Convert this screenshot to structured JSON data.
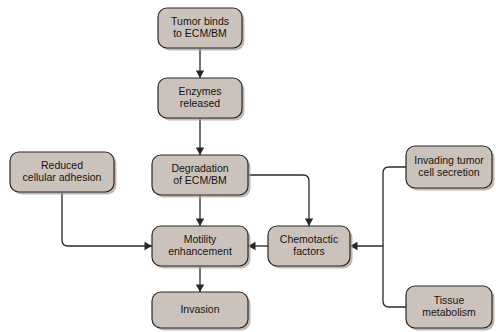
{
  "diagram": {
    "background_color": "#ffffff",
    "node_fill_color": "#cbc3bb",
    "node_stroke_color": "#2b2724",
    "connector_color": "#2b2724",
    "nodes": [
      {
        "id": "tumor-binds",
        "lines": [
          "Tumor binds",
          "to ECM/BM"
        ],
        "x": 158,
        "y": 8,
        "width": 84,
        "height": 40
      },
      {
        "id": "enzymes-released",
        "lines": [
          "Enzymes",
          "released"
        ],
        "x": 158,
        "y": 78,
        "width": 84,
        "height": 40
      },
      {
        "id": "degradation",
        "lines": [
          "Degradation",
          "of ECM/BM"
        ],
        "x": 152,
        "y": 155,
        "width": 96,
        "height": 40
      },
      {
        "id": "reduced-adhesion",
        "lines": [
          "Reduced",
          "cellular adhesion"
        ],
        "x": 10,
        "y": 152,
        "width": 104,
        "height": 40
      },
      {
        "id": "invading-tumor",
        "lines": [
          "Invading tumor",
          "cell secretion"
        ],
        "x": 406,
        "y": 146,
        "width": 86,
        "height": 42
      },
      {
        "id": "motility",
        "lines": [
          "Motility",
          "enhancement"
        ],
        "x": 152,
        "y": 226,
        "width": 96,
        "height": 40
      },
      {
        "id": "chemotactic",
        "lines": [
          "Chemotactic",
          "factors"
        ],
        "x": 268,
        "y": 226,
        "width": 82,
        "height": 40
      },
      {
        "id": "invasion",
        "lines": [
          "Invasion"
        ],
        "x": 152,
        "y": 292,
        "width": 96,
        "height": 36
      },
      {
        "id": "tissue-metabolism",
        "lines": [
          "Tissue",
          "metabolism"
        ],
        "x": 406,
        "y": 286,
        "width": 86,
        "height": 42
      }
    ],
    "connectors": [
      {
        "id": "tumor-to-enzymes",
        "from": "tumor-binds",
        "to": "enzymes-released",
        "path": "M 200 48 L 200 78",
        "arrow": {
          "x": 200,
          "y": 78,
          "dir": "down"
        }
      },
      {
        "id": "enzymes-to-degradation",
        "from": "enzymes-released",
        "to": "degradation",
        "path": "M 200 118 L 200 155",
        "arrow": {
          "x": 200,
          "y": 155,
          "dir": "down"
        }
      },
      {
        "id": "degradation-to-motility",
        "from": "degradation",
        "to": "motility",
        "path": "M 200 195 L 200 226",
        "arrow": {
          "x": 200,
          "y": 226,
          "dir": "down"
        }
      },
      {
        "id": "degradation-to-chemotactic",
        "from": "degradation",
        "to": "chemotactic",
        "path": "M 248 175 L 303 175 Q 309 175 309 181 L 309 226",
        "arrow": {
          "x": 309,
          "y": 226,
          "dir": "down"
        }
      },
      {
        "id": "adhesion-to-motility",
        "from": "reduced-adhesion",
        "to": "motility",
        "path": "M 62 192 L 62 240 Q 62 246 68 246 L 152 246",
        "arrow": {
          "x": 152,
          "y": 246,
          "dir": "right"
        }
      },
      {
        "id": "chemotactic-to-motility",
        "from": "chemotactic",
        "to": "motility",
        "path": "M 268 246 L 248 246",
        "arrow": {
          "x": 248,
          "y": 246,
          "dir": "left"
        }
      },
      {
        "id": "invading-tumor-to-chemotactic",
        "from": "invading-tumor",
        "to": "chemotactic",
        "path": "M 406 167 L 389 167 Q 383 167 383 173 L 383 246 L 350 246",
        "arrow": {
          "x": 350,
          "y": 246,
          "dir": "left"
        }
      },
      {
        "id": "tissue-metabolism-to-chemotactic",
        "from": "tissue-metabolism",
        "to": "chemotactic",
        "path": "M 406 307 L 389 307 Q 383 307 383 301 L 383 246",
        "arrow": null
      },
      {
        "id": "motility-to-invasion",
        "from": "motility",
        "to": "invasion",
        "path": "M 200 266 L 200 292",
        "arrow": {
          "x": 200,
          "y": 292,
          "dir": "down"
        }
      }
    ]
  }
}
